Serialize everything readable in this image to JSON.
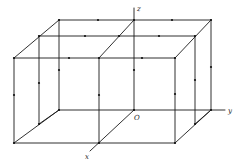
{
  "diagram": {
    "type": "3d-lattice-box",
    "colors": {
      "line": "#1a1a1a",
      "dot": "#111111",
      "label": "#222222",
      "background": "#ffffff"
    },
    "axes": {
      "z": {
        "label": "z",
        "from": [
          134,
          110
        ],
        "to": [
          134,
          8
        ],
        "label_pos": [
          137,
          11
        ]
      },
      "y": {
        "label": "y",
        "from": [
          134,
          110
        ],
        "to": [
          225,
          110
        ],
        "label_pos": [
          228,
          113
        ]
      },
      "x": {
        "label": "x",
        "from": [
          134,
          110
        ],
        "to": [
          90,
          151
        ],
        "label_pos": [
          85,
          159
        ]
      },
      "origin": {
        "label": "O",
        "pos": [
          134,
          110
        ],
        "label_pos": [
          134,
          120
        ]
      }
    },
    "edges": [
      [
        [
          14,
          58
        ],
        [
          175,
          58
        ]
      ],
      [
        [
          14,
          143
        ],
        [
          175,
          143
        ]
      ],
      [
        [
          14,
          58
        ],
        [
          14,
          143
        ]
      ],
      [
        [
          175,
          58
        ],
        [
          175,
          143
        ]
      ],
      [
        [
          99,
          58
        ],
        [
          99,
          143
        ]
      ],
      [
        [
          39,
          36
        ],
        [
          195,
          36
        ]
      ],
      [
        [
          39,
          36
        ],
        [
          39,
          124
        ]
      ],
      [
        [
          195,
          36
        ],
        [
          195,
          124
        ]
      ],
      [
        [
          39,
          124
        ],
        [
          59,
          110
        ]
      ],
      [
        [
          195,
          124
        ],
        [
          211,
          110
        ]
      ],
      [
        [
          59,
          20
        ],
        [
          211,
          20
        ]
      ],
      [
        [
          59,
          20
        ],
        [
          59,
          110
        ]
      ],
      [
        [
          211,
          20
        ],
        [
          211,
          110
        ]
      ],
      [
        [
          59,
          110
        ],
        [
          134,
          110
        ]
      ],
      [
        [
          14,
          58
        ],
        [
          59,
          20
        ]
      ],
      [
        [
          175,
          58
        ],
        [
          211,
          20
        ]
      ],
      [
        [
          14,
          143
        ],
        [
          59,
          110
        ]
      ],
      [
        [
          175,
          143
        ],
        [
          211,
          110
        ]
      ],
      [
        [
          99,
          58
        ],
        [
          134,
          20
        ]
      ]
    ],
    "dots": [
      [
        14,
        58
      ],
      [
        175,
        58
      ],
      [
        14,
        143
      ],
      [
        175,
        143
      ],
      [
        39,
        36
      ],
      [
        195,
        36
      ],
      [
        39,
        124
      ],
      [
        195,
        124
      ],
      [
        59,
        20
      ],
      [
        211,
        20
      ],
      [
        59,
        110
      ],
      [
        211,
        110
      ],
      [
        99,
        58
      ],
      [
        99,
        143
      ],
      [
        134,
        20
      ],
      [
        134,
        110
      ],
      [
        119,
        36
      ],
      [
        98,
        20
      ],
      [
        172,
        20
      ],
      [
        85,
        36
      ],
      [
        159,
        36
      ],
      [
        69,
        58
      ],
      [
        142,
        58
      ],
      [
        14,
        95
      ],
      [
        99,
        95
      ],
      [
        175,
        94
      ],
      [
        39,
        83
      ],
      [
        195,
        80
      ],
      [
        59,
        70
      ],
      [
        134,
        70
      ],
      [
        211,
        67
      ]
    ]
  }
}
